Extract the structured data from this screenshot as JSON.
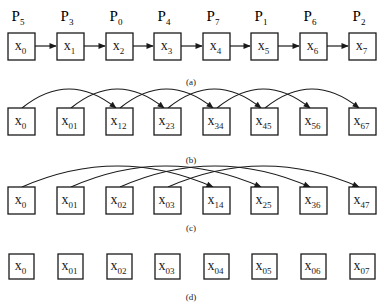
{
  "figure": {
    "panels": [
      {
        "id": "a",
        "caption": "(a)",
        "processors": [
          {
            "base": "P",
            "sub": "5"
          },
          {
            "base": "P",
            "sub": "3"
          },
          {
            "base": "P",
            "sub": "0"
          },
          {
            "base": "P",
            "sub": "4"
          },
          {
            "base": "P",
            "sub": "7"
          },
          {
            "base": "P",
            "sub": "1"
          },
          {
            "base": "P",
            "sub": "6"
          },
          {
            "base": "P",
            "sub": "2"
          }
        ],
        "nodes": [
          {
            "base": "x",
            "sub": "0"
          },
          {
            "base": "x",
            "sub": "1"
          },
          {
            "base": "x",
            "sub": "2"
          },
          {
            "base": "x",
            "sub": "3"
          },
          {
            "base": "x",
            "sub": "4"
          },
          {
            "base": "x",
            "sub": "5"
          },
          {
            "base": "x",
            "sub": "6"
          },
          {
            "base": "x",
            "sub": "7"
          }
        ],
        "edges": "straight arrows i -> i+1"
      },
      {
        "id": "b",
        "caption": "(b)",
        "nodes": [
          {
            "base": "x",
            "sub": "0"
          },
          {
            "base": "x",
            "sub": "01"
          },
          {
            "base": "x",
            "sub": "12"
          },
          {
            "base": "x",
            "sub": "23"
          },
          {
            "base": "x",
            "sub": "34"
          },
          {
            "base": "x",
            "sub": "45"
          },
          {
            "base": "x",
            "sub": "56"
          },
          {
            "base": "x",
            "sub": "67"
          }
        ],
        "edges": "curved arcs i -> i+2"
      },
      {
        "id": "c",
        "caption": "(c)",
        "nodes": [
          {
            "base": "x",
            "sub": "0"
          },
          {
            "base": "x",
            "sub": "01"
          },
          {
            "base": "x",
            "sub": "02"
          },
          {
            "base": "x",
            "sub": "03"
          },
          {
            "base": "x",
            "sub": "14"
          },
          {
            "base": "x",
            "sub": "25"
          },
          {
            "base": "x",
            "sub": "36"
          },
          {
            "base": "x",
            "sub": "47"
          }
        ],
        "edges": "curved arcs i -> i+4"
      },
      {
        "id": "d",
        "caption": "(d)",
        "nodes": [
          {
            "base": "x",
            "sub": "0"
          },
          {
            "base": "x",
            "sub": "01"
          },
          {
            "base": "x",
            "sub": "02"
          },
          {
            "base": "x",
            "sub": "03"
          },
          {
            "base": "x",
            "sub": "04"
          },
          {
            "base": "x",
            "sub": "05"
          },
          {
            "base": "x",
            "sub": "06"
          },
          {
            "base": "x",
            "sub": "07"
          }
        ],
        "edges": "none"
      }
    ]
  }
}
